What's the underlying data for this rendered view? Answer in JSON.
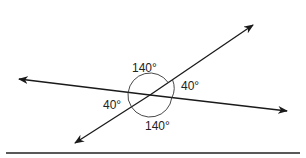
{
  "diagram": {
    "type": "intersecting-lines-angles",
    "colors": {
      "line": "#1a1a1a",
      "background": "#ffffff",
      "text": "#222222"
    },
    "angles": [
      {
        "position": "top",
        "label": "140°"
      },
      {
        "position": "right",
        "label": "40°"
      },
      {
        "position": "left",
        "label": "40°"
      },
      {
        "position": "bottom",
        "label": "140°"
      }
    ],
    "lines": [
      {
        "name": "nearly-horizontal-line",
        "arrows": "both"
      },
      {
        "name": "diagonal-line",
        "arrows": "both"
      }
    ],
    "baseline": {
      "name": "bottom-rule"
    }
  }
}
